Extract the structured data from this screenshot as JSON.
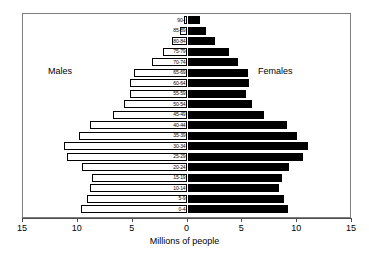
{
  "chart_data": {
    "type": "bar",
    "subtype": "population-pyramid",
    "title": "",
    "xlabel": "Millions of people",
    "ylabel": "",
    "xlim": [
      -15,
      15
    ],
    "xticks": [
      15,
      10,
      5,
      0,
      5,
      10,
      15
    ],
    "xtick_values": [
      -15,
      -10,
      -5,
      0,
      5,
      10,
      15
    ],
    "grid": false,
    "legend_position": "inside-plot",
    "categories": [
      "0-4",
      "5-9",
      "10-14",
      "15-19",
      "20-24",
      "25-29",
      "30-34",
      "35-39",
      "40-44",
      "45-49",
      "50-54",
      "55-59",
      "60-64",
      "65-69",
      "70-74",
      "75-79",
      "80-84",
      "85-89",
      "90+"
    ],
    "series": [
      {
        "name": "Males",
        "color": "#ffffff",
        "edge_color": "#000000",
        "direction": "left",
        "values": [
          9.7,
          9.2,
          8.9,
          8.7,
          9.6,
          11.0,
          11.3,
          9.9,
          8.9,
          6.8,
          5.8,
          5.2,
          5.2,
          4.9,
          3.2,
          2.2,
          1.4,
          0.7,
          0.3
        ]
      },
      {
        "name": "Females",
        "color": "#000000",
        "edge_color": "#000000",
        "direction": "right",
        "values": [
          9.2,
          8.8,
          8.3,
          8.6,
          9.3,
          10.5,
          11.0,
          10.0,
          9.1,
          7.0,
          5.9,
          5.3,
          5.6,
          5.5,
          4.6,
          3.8,
          2.5,
          1.7,
          1.1
        ]
      }
    ]
  },
  "labels": {
    "males": "Males",
    "females": "Females",
    "x_axis_title": "Millions of people"
  },
  "axis": {
    "tick_labels": [
      "15",
      "10",
      "5",
      "0",
      "5",
      "10",
      "15"
    ]
  },
  "colors": {
    "male_fill": "#ffffff",
    "female_fill": "#000000",
    "outline": "#000000",
    "frame": "#7d7d7d",
    "background": "#ffffff"
  }
}
